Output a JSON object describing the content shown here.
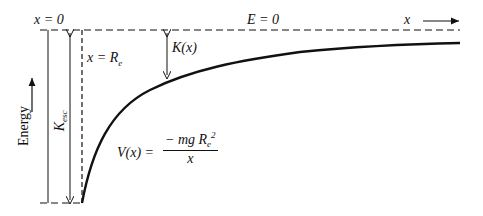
{
  "figure": {
    "type": "potential-energy-diagram",
    "labels": {
      "x_zero": "x = 0",
      "e_zero": "E = 0",
      "x_axis": "x",
      "x_re_prefix": "x = ",
      "x_re_var": "R",
      "x_re_sub": "e",
      "kinetic": "K(x)",
      "k_esc_main": "K",
      "k_esc_sub": "esc",
      "energy_axis": "Energy",
      "potential_lhs": "V(x) =",
      "potential_num_prefix": "− mg R",
      "potential_num_sub": "e",
      "potential_num_sup": "2",
      "potential_den": "x"
    },
    "colors": {
      "ink": "#111111",
      "background": "#ffffff"
    }
  }
}
